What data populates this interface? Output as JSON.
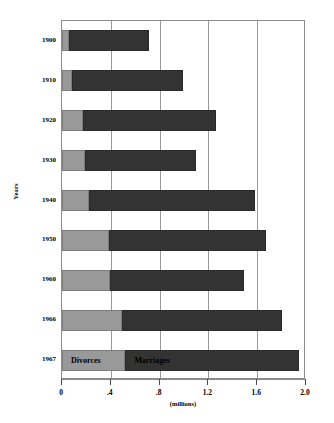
{
  "chart_data": {
    "type": "bar",
    "orientation": "horizontal",
    "stacked": true,
    "title": "",
    "xlabel": "(millions)",
    "ylabel": "Years",
    "xlim": [
      0,
      2.0
    ],
    "grid": true,
    "grid_axis": "x",
    "legend_position": "inside-bars-bottom-row",
    "categories": [
      "1900",
      "1910",
      "1920",
      "1930",
      "1940",
      "1950",
      "1960",
      "1966",
      "1967"
    ],
    "x_ticks": [
      "0",
      ".4",
      ".8",
      "1.2",
      "1.6",
      "2.0"
    ],
    "x_tick_values": [
      0,
      0.4,
      0.8,
      1.2,
      1.6,
      2.0
    ],
    "series": [
      {
        "name": "Divorces",
        "color": "#999999",
        "values": [
          0.055,
          0.083,
          0.171,
          0.191,
          0.22,
          0.385,
          0.393,
          0.49,
          0.52
        ]
      },
      {
        "name": "Marriages",
        "color": "#333333",
        "values": [
          0.656,
          0.909,
          1.09,
          0.91,
          1.36,
          1.285,
          1.097,
          1.31,
          1.42
        ]
      }
    ],
    "cumulative_ends": {
      "divorces": [
        0.055,
        0.083,
        0.171,
        0.191,
        0.22,
        0.385,
        0.393,
        0.49,
        0.52
      ],
      "marriages": [
        0.711,
        0.992,
        1.261,
        1.101,
        1.58,
        1.67,
        1.49,
        1.8,
        1.94
      ]
    },
    "legend": [
      {
        "label": "Divorces",
        "color": "#999999"
      },
      {
        "label": "Marriages",
        "color": "#333333"
      }
    ]
  },
  "colors": {
    "divorces": "#999999",
    "marriages": "#333333",
    "grid": "#9a9a9a",
    "frame": "#8c8c8c",
    "background": "#ffffff",
    "text": "#000000"
  }
}
